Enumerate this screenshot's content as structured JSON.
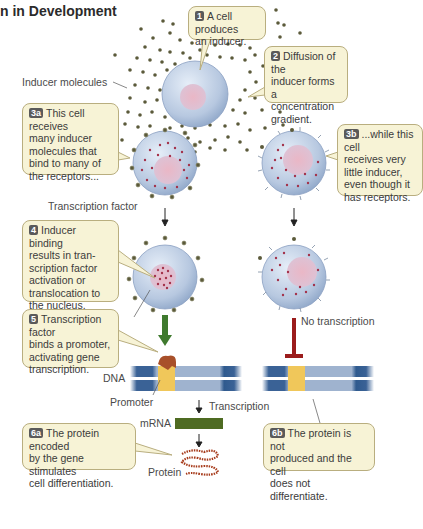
{
  "title": "n in Development",
  "callouts": {
    "c1": {
      "badge": "1",
      "text": "A cell produces\nan inducer."
    },
    "c2": {
      "badge": "2",
      "text": "Diffusion of the\ninducer forms a\nconcentration\ngradient."
    },
    "c3a": {
      "badge": "3a",
      "text": "This cell receives\nmany inducer\nmolecules that\nbind to many of\nthe receptors..."
    },
    "c3b": {
      "badge": "3b",
      "text": "...while this cell\nreceives very\nlittle inducer,\neven though it\nhas receptors."
    },
    "c4": {
      "badge": "4",
      "text": "Inducer binding\nresults in tran-\nscription factor\nactivation or\ntranslocation to\nthe nucleus."
    },
    "c5": {
      "badge": "5",
      "text": "Transcription factor\nbinds a promoter,\nactivating gene\ntranscription."
    },
    "c6a": {
      "badge": "6a",
      "text": "The protein encoded\nby the gene stimulates\ncell differentiation."
    },
    "c6b": {
      "badge": "6b",
      "text": "The protein is not\nproduced and the cell\ndoes not differentiate."
    }
  },
  "labels": {
    "inducer_molecules": "Inducer molecules",
    "transcription_factor": "Transcription factor",
    "no_transcription": "No transcription",
    "dna": "DNA",
    "promoter": "Promoter",
    "transcription": "Transcription",
    "mrna": "mRNA",
    "protein": "Protein"
  },
  "colors": {
    "callout_bg": "#f7f3d6",
    "callout_border": "#b9ae7f",
    "cell": "#b8c8e0",
    "nucleus": "#e6b8c8",
    "inducer": "#5b5a3a",
    "tf_dot": "#a3324a",
    "dna_dark": "#2f5a8e",
    "dna_light": "#9fb3cf",
    "promoter": "#f0c75a",
    "green_arrow": "#3f7a2e",
    "mrna": "#4e6b22",
    "red_block": "#9b1c1c",
    "protein": "#a63a1a"
  }
}
